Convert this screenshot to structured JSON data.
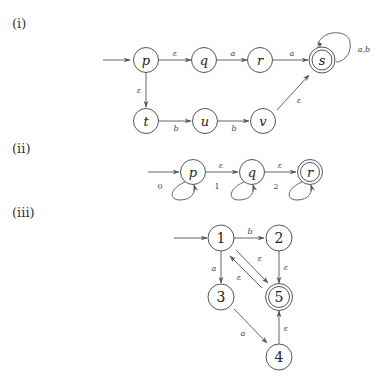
{
  "diagrams": [
    {
      "label": "(i)",
      "start_state": "p",
      "accepting_states": [
        "s"
      ],
      "states": [
        "p",
        "q",
        "r",
        "s",
        "t",
        "u",
        "v"
      ],
      "transitions": [
        {
          "from": "p",
          "to": "q",
          "label": "ε"
        },
        {
          "from": "q",
          "to": "r",
          "label": "a"
        },
        {
          "from": "r",
          "to": "s",
          "label": "a"
        },
        {
          "from": "s",
          "to": "s",
          "label": "a,b"
        },
        {
          "from": "p",
          "to": "t",
          "label": "ε"
        },
        {
          "from": "t",
          "to": "u",
          "label": "b"
        },
        {
          "from": "u",
          "to": "v",
          "label": "b"
        },
        {
          "from": "v",
          "to": "s",
          "label": "ε"
        }
      ]
    },
    {
      "label": "(ii)",
      "start_state": "p",
      "accepting_states": [
        "r"
      ],
      "states": [
        "p",
        "q",
        "r"
      ],
      "transitions": [
        {
          "from": "p",
          "to": "p",
          "label": "0"
        },
        {
          "from": "p",
          "to": "q",
          "label": "ε"
        },
        {
          "from": "q",
          "to": "q",
          "label": "1"
        },
        {
          "from": "q",
          "to": "r",
          "label": "ε"
        },
        {
          "from": "r",
          "to": "r",
          "label": "2"
        }
      ]
    },
    {
      "label": "(iii)",
      "start_state": "1",
      "accepting_states": [
        "5"
      ],
      "states": [
        "1",
        "2",
        "3",
        "4",
        "5"
      ],
      "transitions": [
        {
          "from": "1",
          "to": "2",
          "label": "b"
        },
        {
          "from": "1",
          "to": "3",
          "label": "a"
        },
        {
          "from": "1",
          "to": "5",
          "label": "ε"
        },
        {
          "from": "5",
          "to": "1",
          "label": "ε"
        },
        {
          "from": "2",
          "to": "5",
          "label": "ε"
        },
        {
          "from": "3",
          "to": "4",
          "label": "a"
        },
        {
          "from": "4",
          "to": "5",
          "label": "ε"
        }
      ]
    }
  ]
}
